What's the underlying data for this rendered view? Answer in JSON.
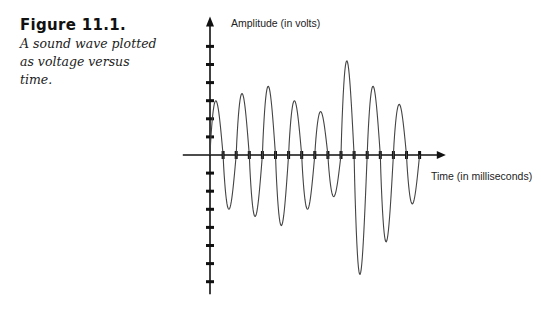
{
  "figure": {
    "title": "Figure 11.1.",
    "caption": "A sound wave plotted as voltage versus time."
  },
  "chart_data": {
    "type": "line",
    "title": "",
    "xlabel": "Time (in milliseconds)",
    "ylabel": "Amplitude (in volts)",
    "x_ticks_count": 16,
    "y_ticks_positive_count": 6,
    "y_ticks_negative_count": 7,
    "grid": false,
    "legend": "none",
    "xlim": [
      -2,
      18
    ],
    "ylim": [
      -7.7,
      7.6
    ],
    "tick_labels": [],
    "series": [
      {
        "name": "sound wave",
        "description": "8 cycles, each a positive then negative half-cycle of 1 tick-unit width",
        "half_cycle_width": 1,
        "peaks": [
          3.0,
          3.4,
          3.8,
          3.0,
          2.4,
          5.2,
          3.8,
          2.8
        ],
        "troughs": [
          -3.0,
          -3.4,
          -3.9,
          -3.0,
          -2.3,
          -6.6,
          -4.8,
          -2.7
        ]
      }
    ],
    "colors": {
      "axis": "#111111",
      "wave": "#444444"
    }
  }
}
